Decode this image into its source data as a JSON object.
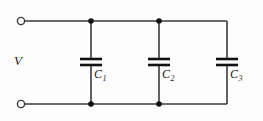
{
  "diagram": {
    "type": "electrical-schematic",
    "background_color": "#fdfdfd",
    "wire_color": "#3a3a3a",
    "label_color": "#1a1a1a",
    "source": {
      "label": "V",
      "terminal_style": "open-circle",
      "terminals": [
        {
          "name": "top-terminal",
          "x": 19,
          "y": 21
        },
        {
          "name": "bottom-terminal",
          "x": 19,
          "y": 104
        }
      ]
    },
    "rails": {
      "top_y": 21,
      "bottom_y": 104,
      "left_x": 19,
      "right_x": 227
    },
    "nodes": [
      {
        "name": "node-top-1",
        "x": 91,
        "y": 21,
        "filled": true
      },
      {
        "name": "node-top-2",
        "x": 159,
        "y": 21,
        "filled": true
      },
      {
        "name": "node-bottom-1",
        "x": 91,
        "y": 104,
        "filled": true
      },
      {
        "name": "node-bottom-2",
        "x": 159,
        "y": 104,
        "filled": true
      }
    ],
    "capacitors": [
      {
        "name": "capacitor-c1",
        "label": "C",
        "subscript": "1",
        "branch_x": 91,
        "plate_half_width": 11,
        "plate_top_y": 59,
        "plate_bottom_y": 65,
        "label_x": 94,
        "label_y": 68
      },
      {
        "name": "capacitor-c2",
        "label": "C",
        "subscript": "2",
        "branch_x": 159,
        "plate_half_width": 11,
        "plate_top_y": 59,
        "plate_bottom_y": 65,
        "label_x": 162,
        "label_y": 68
      },
      {
        "name": "capacitor-c3",
        "label": "C",
        "subscript": "3",
        "branch_x": 227,
        "plate_half_width": 11,
        "plate_top_y": 59,
        "plate_bottom_y": 65,
        "label_x": 230,
        "label_y": 68
      }
    ]
  }
}
